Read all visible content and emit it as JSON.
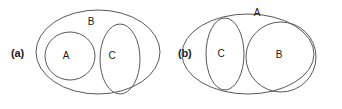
{
  "figure": {
    "width": 342,
    "height": 109,
    "background_color": "#ffffff",
    "stroke_color": "#595959",
    "text_color": "#1a1a1a"
  },
  "panels": [
    {
      "id": "a",
      "label": "(a)",
      "description": "Set A and set C are both entirely contained within set B; A and C are disjoint from each other.",
      "sets": [
        {
          "name": "B",
          "label": "B",
          "shape": "ellipse",
          "cx": 98,
          "cy": 52,
          "rx": 62,
          "ry": 42,
          "label_x": 91,
          "label_y": 22
        },
        {
          "name": "A",
          "label": "A",
          "shape": "ellipse",
          "cx": 70,
          "cy": 56,
          "rx": 25,
          "ry": 24,
          "label_x": 66,
          "label_y": 56
        },
        {
          "name": "C",
          "label": "C",
          "shape": "ellipse",
          "cx": 120,
          "cy": 59,
          "rx": 20,
          "ry": 35,
          "label_x": 112,
          "label_y": 56
        }
      ]
    },
    {
      "id": "b",
      "label": "(b)",
      "description": "Set C is entirely contained within set A; set B overlaps set A, extending beyond its right boundary.",
      "sets": [
        {
          "name": "A",
          "label": "A",
          "shape": "ellipse",
          "cx": 77,
          "cy": 54,
          "rx": 66,
          "ry": 40,
          "label_x": 86,
          "label_y": 13
        },
        {
          "name": "C",
          "label": "C",
          "shape": "ellipse",
          "cx": 54,
          "cy": 54,
          "rx": 19,
          "ry": 36,
          "label_x": 50,
          "label_y": 54
        },
        {
          "name": "B",
          "label": "B",
          "shape": "ellipse",
          "cx": 110,
          "cy": 57,
          "rx": 35,
          "ry": 35,
          "label_x": 108,
          "label_y": 55
        }
      ]
    }
  ]
}
